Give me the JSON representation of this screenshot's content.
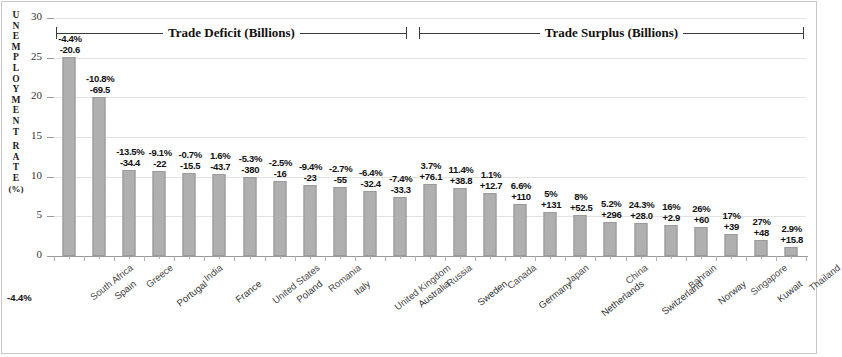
{
  "axis": {
    "y_title_chars": [
      "U",
      "N",
      "E",
      "M",
      "P",
      "L",
      "O",
      "Y",
      "M",
      "E",
      "N",
      "T",
      "",
      "R",
      "A",
      "T",
      "E"
    ],
    "y_title_unit": "(%)",
    "y_title_full": "UNEMPLOYMENT RATE (%)",
    "y_ticks": [
      "30",
      "25",
      "20",
      "15",
      "10",
      "5",
      "0"
    ],
    "stray_label": "-4.4%"
  },
  "groups": [
    {
      "label": "Trade Deficit (Billions)"
    },
    {
      "label": "Trade Surplus (Billions)"
    }
  ],
  "colors": {
    "bar": "#a6a6a6",
    "bar_border": "#9a9a9a",
    "grid": "#e2e2e2",
    "axis": "#9a9a9a",
    "frame": "#c8c8c8",
    "text": "#111111"
  },
  "chart_data": {
    "type": "bar",
    "title": "",
    "xlabel": "",
    "ylabel": "UNEMPLOYMENT RATE (%)",
    "ylim": [
      0,
      30
    ],
    "yticks": [
      0,
      5,
      10,
      15,
      20,
      25,
      30
    ],
    "grid": true,
    "legend": "none",
    "annotations": [
      "Trade Deficit (Billions)",
      "Trade Surplus (Billions)"
    ],
    "categories": [
      "South Africa",
      "Spain",
      "Greece",
      "Portugal",
      "India",
      "France",
      "United States",
      "Poland",
      "Romania",
      "Italy",
      "United Kingdom",
      "Australia",
      "Russia",
      "Sweden",
      "Canada",
      "Germany",
      "Japan",
      "Netherlands",
      "China",
      "Switzerland",
      "Bahrain",
      "Norway",
      "Singapore",
      "Kuwait",
      "Thailand"
    ],
    "values": [
      25.1,
      20.0,
      10.9,
      10.7,
      10.5,
      10.3,
      9.9,
      9.4,
      8.9,
      8.7,
      8.2,
      7.4,
      9.1,
      8.6,
      7.9,
      6.6,
      5.5,
      5.2,
      4.3,
      4.1,
      3.9,
      3.6,
      2.8,
      2.0,
      1.1
    ],
    "labels_pct": [
      "-4.4%",
      "-10.8%",
      "-13.5%",
      "-9.1%",
      "-0.7%",
      "1.6%",
      "-5.3%",
      "-2.5%",
      "-9.4%",
      "-2.7%",
      "-6.4%",
      "-7.4%",
      "3.7%",
      "11.4%",
      "1.1%",
      "6.6%",
      "5%",
      "8%",
      "5.2%",
      "24.3%",
      "16%",
      "26%",
      "17%",
      "27%",
      "2.9%"
    ],
    "labels_trade": [
      "-20.6",
      "-69.5",
      "-34.4",
      "-22",
      "-15.5",
      "-43.7",
      "-380",
      "-16",
      "-23",
      "-55",
      "-32.4",
      "-33.3",
      "+76.1",
      "+38.8",
      "+12.7",
      "+110",
      "+131",
      "+52.5",
      "+296",
      "+28.0",
      "+2.9",
      "+60",
      "+39",
      "+48",
      "+15.8"
    ],
    "group_of": [
      "deficit",
      "deficit",
      "deficit",
      "deficit",
      "deficit",
      "deficit",
      "deficit",
      "deficit",
      "deficit",
      "deficit",
      "deficit",
      "deficit",
      "surplus",
      "surplus",
      "surplus",
      "surplus",
      "surplus",
      "surplus",
      "surplus",
      "surplus",
      "surplus",
      "surplus",
      "surplus",
      "surplus",
      "surplus"
    ]
  }
}
